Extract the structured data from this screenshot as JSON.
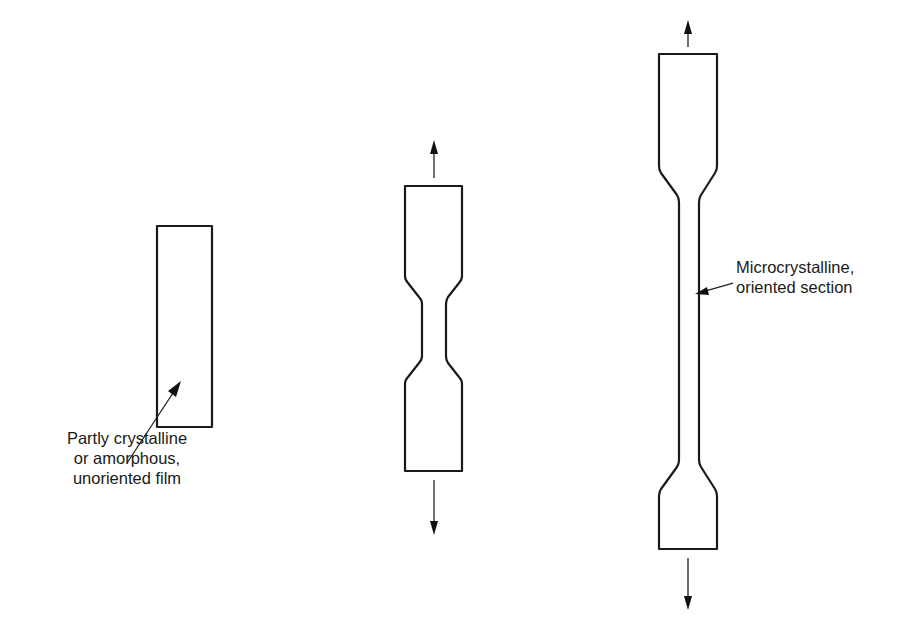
{
  "figure": {
    "stages": [
      {
        "id": "stage-1",
        "description": "Undrawn rectangular film strip"
      },
      {
        "id": "stage-2",
        "description": "Neck formation under tension"
      },
      {
        "id": "stage-3",
        "description": "Neck propagated along specimen (drawn)"
      }
    ],
    "labels": {
      "film": {
        "lines": [
          "Partly crystalline",
          "or amorphous,",
          "unoriented film"
        ]
      },
      "oriented": {
        "lines": [
          "Microcrystalline,",
          "oriented section"
        ]
      }
    },
    "arrows": {
      "stage_2": [
        "tension-up",
        "tension-down"
      ],
      "stage_3": [
        "tension-up",
        "tension-down"
      ]
    },
    "colors": {
      "line": "#1a1a1a",
      "background": "#ffffff"
    }
  }
}
